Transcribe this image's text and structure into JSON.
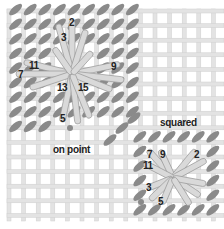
{
  "diagram": {
    "type": "needlepoint-stitch-diagram",
    "colors": {
      "background": "#ffffff",
      "canvas_thread": "#e3e3e3",
      "canvas_thread_edge": "#cfcfcf",
      "background_stitch": "#8a8a8a",
      "star_stitch_fill": "#d9d9d9",
      "star_stitch_edge": "#9a9a9a",
      "text": "#222222"
    },
    "on_point": {
      "caption": "on point",
      "numbers": [
        "2",
        "3",
        "7",
        "9",
        "11",
        "13",
        "15",
        "5"
      ]
    },
    "squared": {
      "caption": "squared",
      "numbers": [
        "7",
        "9",
        "2",
        "11",
        "3",
        "5"
      ]
    }
  }
}
